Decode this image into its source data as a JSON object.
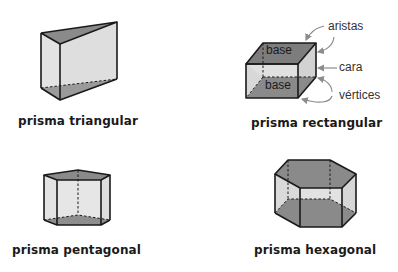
{
  "figures": {
    "triangular": {
      "caption": "prisma triangular"
    },
    "rectangular": {
      "caption": "prisma rectangular",
      "base_top": "base",
      "base_bottom": "base",
      "annotations": {
        "edges": "aristas",
        "face": "cara",
        "vertices": "vértices"
      }
    },
    "pentagonal": {
      "caption": "prisma pentagonal"
    },
    "hexagonal": {
      "caption": "prisma hexagonal"
    }
  },
  "colors": {
    "base_fill": "#8a8a8a",
    "face_fill": "#dcdcdc",
    "edge": "#1a1a1a",
    "arrow": "#8c8c8c"
  }
}
